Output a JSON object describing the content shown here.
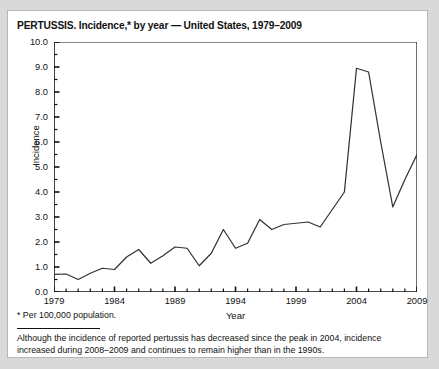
{
  "figure": {
    "title": "PERTUSSIS. Incidence,* by year — United States, 1979–2009",
    "footnote_star": "* Per 100,000 population.",
    "footnote_body": "Although the incidence of reported pertussis has decreased since the peak in 2004, incidence increased during 2008–2009 and continues to remain higher than in the 1990s."
  },
  "chart_data": {
    "type": "line",
    "title": "PERTUSSIS. Incidence,* by year — United States, 1979–2009",
    "xlabel": "Year",
    "ylabel": "Incidence",
    "xlim": [
      1979,
      2009
    ],
    "ylim": [
      0.0,
      10.0
    ],
    "ytick_step": 1.0,
    "yminor_step": 0.5,
    "xtick_step": 1,
    "xlabel_step": 5,
    "grid": false,
    "legend": null,
    "line_color": "#333333",
    "ytick_labels": [
      "0.0",
      "1.0",
      "2.0",
      "3.0",
      "4.0",
      "5.0",
      "6.0",
      "7.0",
      "8.0",
      "9.0",
      "10.0"
    ],
    "xtick_labels": [
      "1979",
      "1984",
      "1989",
      "1994",
      "1999",
      "2004",
      "2009"
    ],
    "x": [
      1979,
      1980,
      1981,
      1982,
      1983,
      1984,
      1985,
      1986,
      1987,
      1988,
      1989,
      1990,
      1991,
      1992,
      1993,
      1994,
      1995,
      1996,
      1997,
      1998,
      1999,
      2000,
      2001,
      2002,
      2003,
      2004,
      2005,
      2006,
      2007,
      2008,
      2009
    ],
    "values": [
      0.7,
      0.72,
      0.5,
      0.75,
      0.95,
      0.9,
      1.4,
      1.7,
      1.15,
      1.45,
      1.8,
      1.75,
      1.05,
      1.55,
      2.5,
      1.75,
      1.95,
      2.9,
      2.5,
      2.7,
      2.75,
      2.8,
      2.6,
      3.3,
      4.0,
      8.95,
      8.8,
      6.0,
      3.4,
      4.5,
      5.5
    ]
  }
}
